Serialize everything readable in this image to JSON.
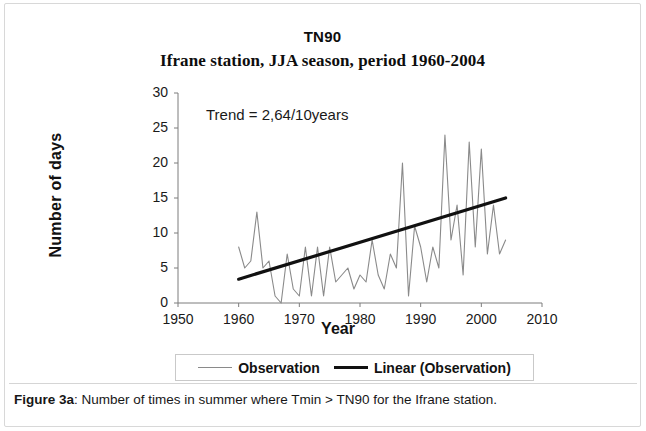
{
  "figure": {
    "caption_label": "Figure 3a",
    "caption_sep": ": ",
    "caption_text": "Number of times in summer where Tmin > TN90 for the Ifrane station."
  },
  "chart_data": {
    "type": "line",
    "title": "TN90",
    "subtitle": "Ifrane station, JJA season, period 1960-2004",
    "xlabel": "Year",
    "ylabel": "Number  of days",
    "xlim": [
      1950,
      2010
    ],
    "ylim": [
      0,
      30
    ],
    "xticks": [
      1950,
      1960,
      1970,
      1980,
      1990,
      2000,
      2010
    ],
    "yticks": [
      0,
      5,
      10,
      15,
      20,
      25,
      30
    ],
    "grid": false,
    "legend_position": "bottom",
    "annotation": "Trend = 2,64/10years",
    "series": [
      {
        "name": "Observation",
        "style": "thin-line",
        "color": "#8a8a8a",
        "x": [
          1960,
          1961,
          1962,
          1963,
          1964,
          1965,
          1966,
          1967,
          1968,
          1969,
          1970,
          1971,
          1972,
          1973,
          1974,
          1975,
          1976,
          1977,
          1978,
          1979,
          1980,
          1981,
          1982,
          1983,
          1984,
          1985,
          1986,
          1987,
          1988,
          1989,
          1990,
          1991,
          1992,
          1993,
          1994,
          1995,
          1996,
          1997,
          1998,
          1999,
          2000,
          2001,
          2002,
          2003,
          2004
        ],
        "values": [
          8,
          5,
          6,
          13,
          5,
          6,
          1,
          0,
          7,
          2,
          1,
          8,
          1,
          8,
          1,
          8,
          3,
          4,
          5,
          2,
          4,
          3,
          9,
          4,
          2,
          7,
          5,
          20,
          1,
          11,
          8,
          3,
          8,
          5,
          24,
          9,
          14,
          4,
          23,
          8,
          22,
          7,
          14,
          7,
          9
        ]
      },
      {
        "name": "Linear (Observation)",
        "style": "thick-line",
        "color": "#111111",
        "trend_per_decade": 2.64,
        "x": [
          1960,
          2004
        ],
        "values": [
          3.4,
          15.0
        ]
      }
    ]
  },
  "legend": {
    "entries": [
      {
        "label": "Observation"
      },
      {
        "label": "Linear (Observation)"
      }
    ]
  }
}
